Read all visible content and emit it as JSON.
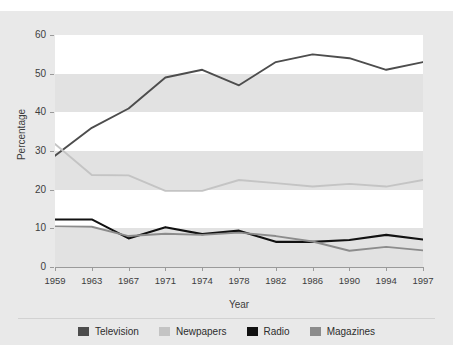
{
  "figure": {
    "background_color": "#e9e9e9",
    "plot_background_color": "#e2e2e2",
    "band_color": "#ffffff",
    "top_ghost_text": ""
  },
  "axes": {
    "y_title": "Percentage",
    "x_title": "Year",
    "y_ticks": [
      "0",
      "10",
      "20",
      "30",
      "40",
      "50",
      "60"
    ],
    "x_ticks": [
      "1959",
      "1963",
      "1967",
      "1971",
      "1974",
      "1978",
      "1982",
      "1986",
      "1990",
      "1994",
      "1997"
    ]
  },
  "legend": {
    "items": [
      {
        "label": "Television",
        "color": "#4d4d4d"
      },
      {
        "label": "Newpapers",
        "color": "#c4c4c4"
      },
      {
        "label": "Radio",
        "color": "#111111"
      },
      {
        "label": "Magazines",
        "color": "#8c8c8c"
      }
    ]
  },
  "chart_data": {
    "type": "line",
    "title": "",
    "xlabel": "Year",
    "ylabel": "Percentage",
    "x": [
      1959,
      1963,
      1967,
      1971,
      1974,
      1978,
      1982,
      1986,
      1990,
      1994,
      1997
    ],
    "categories": [
      "1959",
      "1963",
      "1967",
      "1971",
      "1974",
      "1978",
      "1982",
      "1986",
      "1990",
      "1994",
      "1997"
    ],
    "ylim": [
      0,
      60
    ],
    "xlim": [
      1959,
      1997
    ],
    "grid": false,
    "banded_background": true,
    "legend_position": "bottom",
    "series": [
      {
        "name": "Television",
        "color": "#4d4d4d",
        "values": [
          28.8,
          36.0,
          41.0,
          49.0,
          51.0,
          47.0,
          53.0,
          55.0,
          54.0,
          51.0,
          53.0
        ]
      },
      {
        "name": "Newpapers",
        "color": "#c4c4c4",
        "values": [
          31.8,
          23.8,
          23.7,
          19.7,
          19.7,
          22.5,
          21.7,
          20.8,
          21.5,
          20.8,
          22.5
        ]
      },
      {
        "name": "Radio",
        "color": "#111111",
        "values": [
          12.3,
          12.3,
          7.4,
          10.3,
          8.5,
          9.4,
          6.5,
          6.5,
          7.0,
          8.3,
          7.1
        ]
      },
      {
        "name": "Magazines",
        "color": "#8c8c8c",
        "values": [
          10.5,
          10.4,
          8.0,
          8.6,
          8.3,
          8.9,
          8.0,
          6.6,
          4.2,
          5.2,
          4.3
        ]
      }
    ]
  }
}
